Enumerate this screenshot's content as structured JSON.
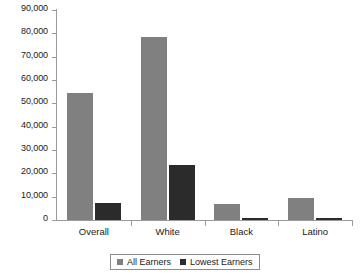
{
  "chart_data": {
    "type": "bar",
    "title": "",
    "subtitle": "",
    "xlabel": "",
    "ylabel": "",
    "categories": [
      "Overall",
      "White",
      "Black",
      "Latino"
    ],
    "series": [
      {
        "name": "All Earners",
        "color": "#808080",
        "values": [
          54500,
          78500,
          7000,
          9500
        ]
      },
      {
        "name": "Lowest Earners",
        "color": "#2b2b2b",
        "values": [
          7500,
          23500,
          800,
          800
        ]
      }
    ],
    "ylim": [
      0,
      90000
    ],
    "ytick_values": [
      0,
      10000,
      20000,
      30000,
      40000,
      50000,
      60000,
      70000,
      80000,
      90000
    ],
    "ytick_labels": [
      "0",
      "10,000",
      "20,000",
      "30,000",
      "40,000",
      "50,000",
      "60,000",
      "70,000",
      "80,000",
      "90,000"
    ],
    "grid": false,
    "legend_position": "bottom"
  },
  "legend": {
    "entries": [
      {
        "label": "All Earners"
      },
      {
        "label": "Lowest Earners"
      }
    ]
  }
}
